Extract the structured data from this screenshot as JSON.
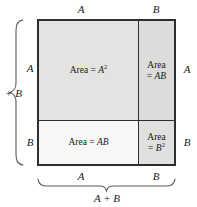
{
  "figure": {
    "colors": {
      "outline": "#2e2e2e",
      "cell_a2_fill": "#e3e3e1",
      "cell_ab_top_fill": "#dcdcda",
      "cell_ab_bottom_fill": "#f7f7f6",
      "cell_b2_fill": "#e0e0de",
      "text": "#1a1a1a",
      "background": "#ffffff"
    }
  },
  "cells": {
    "top_left": {
      "prefix": "Area = ",
      "base": "A",
      "exponent": "2"
    },
    "top_right": {
      "line1": "Area",
      "line2_prefix": "= ",
      "line2_vars": "AB"
    },
    "bottom_left": {
      "prefix": "Area = ",
      "vars": "AB"
    },
    "bottom_right": {
      "line1": "Area",
      "line2_prefix": "= ",
      "line2_base": "B",
      "line2_exponent": "2"
    }
  },
  "labels": {
    "top_a": "A",
    "top_b": "B",
    "right_a": "A",
    "right_b": "B",
    "left_a": "A",
    "left_b": "B",
    "bottom_a": "A",
    "bottom_b": "B",
    "left_sum": "+ B",
    "bottom_sum": "A + B"
  }
}
